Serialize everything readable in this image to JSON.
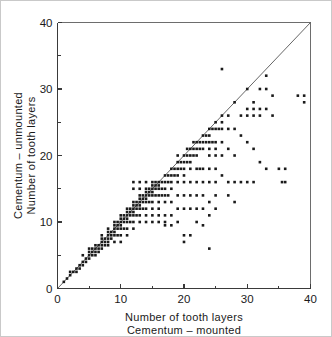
{
  "chart_data": {
    "type": "scatter",
    "title": "",
    "xlabel": "Number of tooth layers",
    "xlabel2": "Cementum – mounted",
    "ylabel": "Cementum – unmounted",
    "ylabel2": "Number of tooth layers",
    "xlim": [
      0,
      40
    ],
    "ylim": [
      0,
      40
    ],
    "xticks": [
      0,
      10,
      20,
      30,
      40
    ],
    "yticks": [
      0,
      10,
      20,
      30,
      40
    ],
    "xticklabels": [
      "0",
      "10",
      "20",
      "30",
      "40"
    ],
    "yticklabels": [
      "0",
      "10",
      "20",
      "30",
      "40"
    ],
    "xminorticks": [
      5,
      15,
      25,
      35
    ],
    "yminorticks": [
      5,
      15,
      25,
      35
    ],
    "grid": false,
    "legend": null,
    "reference_line": {
      "name": "identity-line",
      "type": "y=x",
      "from": [
        0,
        0
      ],
      "to": [
        40,
        40
      ]
    },
    "marker": {
      "shape": "square",
      "size_px": 2.6,
      "color": "#1a1a1a"
    },
    "series": [
      {
        "name": "tooth layer counts",
        "points": [
          [
            1,
            1
          ],
          [
            1.5,
            1.5
          ],
          [
            2,
            2
          ],
          [
            2,
            2.5
          ],
          [
            2.5,
            2.5
          ],
          [
            3,
            3
          ],
          [
            3,
            2.5
          ],
          [
            3.5,
            3.5
          ],
          [
            3.5,
            3
          ],
          [
            4,
            4
          ],
          [
            4,
            3.5
          ],
          [
            4,
            5
          ],
          [
            4.5,
            4
          ],
          [
            4.5,
            4.5
          ],
          [
            5,
            5
          ],
          [
            5,
            4.5
          ],
          [
            5,
            5.5
          ],
          [
            5,
            6
          ],
          [
            5.5,
            5
          ],
          [
            5.5,
            5.5
          ],
          [
            5.5,
            6
          ],
          [
            6,
            6
          ],
          [
            6,
            5.5
          ],
          [
            6,
            5
          ],
          [
            6,
            6.5
          ],
          [
            6.5,
            6
          ],
          [
            6.5,
            6.5
          ],
          [
            6.5,
            5.5
          ],
          [
            7,
            7
          ],
          [
            7,
            6
          ],
          [
            7,
            6.5
          ],
          [
            7,
            7.5
          ],
          [
            7,
            8
          ],
          [
            7.5,
            7
          ],
          [
            7.5,
            7.5
          ],
          [
            7.5,
            6.5
          ],
          [
            8,
            8
          ],
          [
            8,
            7
          ],
          [
            8,
            7.5
          ],
          [
            8,
            8.5
          ],
          [
            8,
            9
          ],
          [
            8,
            6.5
          ],
          [
            8.5,
            8
          ],
          [
            8.5,
            8.5
          ],
          [
            8.5,
            7.5
          ],
          [
            9,
            9
          ],
          [
            9,
            8
          ],
          [
            9,
            8.5
          ],
          [
            9,
            9.5
          ],
          [
            9,
            10
          ],
          [
            9,
            7
          ],
          [
            9.5,
            9
          ],
          [
            9.5,
            9.5
          ],
          [
            9.5,
            10
          ],
          [
            9.5,
            8
          ],
          [
            10,
            10
          ],
          [
            10,
            9
          ],
          [
            10,
            9.5
          ],
          [
            10,
            10.5
          ],
          [
            10,
            11
          ],
          [
            10,
            8
          ],
          [
            10,
            7
          ],
          [
            10.5,
            10
          ],
          [
            10.5,
            10.5
          ],
          [
            10.5,
            11
          ],
          [
            10.5,
            9
          ],
          [
            11,
            11
          ],
          [
            11,
            10
          ],
          [
            11,
            10.5
          ],
          [
            11,
            11.5
          ],
          [
            11,
            12
          ],
          [
            11,
            9
          ],
          [
            11,
            8
          ],
          [
            11.5,
            11
          ],
          [
            11.5,
            11.5
          ],
          [
            11.5,
            12
          ],
          [
            11.5,
            10
          ],
          [
            12,
            12
          ],
          [
            12,
            11
          ],
          [
            12,
            11.5
          ],
          [
            12,
            12.5
          ],
          [
            12,
            13
          ],
          [
            12,
            10
          ],
          [
            12,
            9
          ],
          [
            12,
            15
          ],
          [
            12,
            16
          ],
          [
            12.5,
            12
          ],
          [
            12.5,
            12.5
          ],
          [
            12.5,
            13
          ],
          [
            12.5,
            11
          ],
          [
            13,
            13
          ],
          [
            13,
            12
          ],
          [
            13,
            12.5
          ],
          [
            13,
            13.5
          ],
          [
            13,
            14
          ],
          [
            13,
            11
          ],
          [
            13,
            10
          ],
          [
            13,
            16
          ],
          [
            13,
            15
          ],
          [
            13.5,
            13
          ],
          [
            13.5,
            13.5
          ],
          [
            13.5,
            14
          ],
          [
            13.5,
            12
          ],
          [
            14,
            14
          ],
          [
            14,
            13
          ],
          [
            14,
            13.5
          ],
          [
            14,
            14.5
          ],
          [
            14,
            15
          ],
          [
            14,
            12
          ],
          [
            14,
            11
          ],
          [
            14,
            10
          ],
          [
            14,
            16
          ],
          [
            14.5,
            14
          ],
          [
            14.5,
            14.5
          ],
          [
            14.5,
            15
          ],
          [
            14.5,
            13
          ],
          [
            15,
            15
          ],
          [
            15,
            14
          ],
          [
            15,
            14.5
          ],
          [
            15,
            15.5
          ],
          [
            15,
            16
          ],
          [
            15,
            13
          ],
          [
            15,
            12
          ],
          [
            15,
            11
          ],
          [
            15,
            10
          ],
          [
            15.5,
            15
          ],
          [
            15.5,
            15.5
          ],
          [
            15.5,
            14
          ],
          [
            15.5,
            16
          ],
          [
            16,
            16
          ],
          [
            16,
            15
          ],
          [
            16,
            15.5
          ],
          [
            16,
            14
          ],
          [
            16,
            13
          ],
          [
            16,
            12
          ],
          [
            16,
            11
          ],
          [
            16,
            10
          ],
          [
            16.5,
            16
          ],
          [
            16.5,
            15
          ],
          [
            16.5,
            14
          ],
          [
            17,
            17
          ],
          [
            17,
            16
          ],
          [
            17,
            15
          ],
          [
            17,
            14
          ],
          [
            17,
            13
          ],
          [
            17,
            11
          ],
          [
            17,
            10
          ],
          [
            17,
            9.5
          ],
          [
            17.5,
            17
          ],
          [
            17.5,
            16
          ],
          [
            17.5,
            14
          ],
          [
            18,
            18
          ],
          [
            18,
            17
          ],
          [
            18,
            16
          ],
          [
            18,
            15
          ],
          [
            18,
            13
          ],
          [
            18,
            11
          ],
          [
            18,
            9.5
          ],
          [
            18.5,
            18
          ],
          [
            18.5,
            17
          ],
          [
            19,
            19
          ],
          [
            19,
            18
          ],
          [
            19,
            17
          ],
          [
            19,
            16
          ],
          [
            19,
            14
          ],
          [
            19,
            12
          ],
          [
            19,
            10
          ],
          [
            19,
            20
          ],
          [
            19.5,
            19
          ],
          [
            19.5,
            18
          ],
          [
            20,
            20
          ],
          [
            20,
            19
          ],
          [
            20,
            18
          ],
          [
            20,
            17
          ],
          [
            20,
            16
          ],
          [
            20,
            14
          ],
          [
            20,
            12
          ],
          [
            20,
            8
          ],
          [
            20,
            7
          ],
          [
            20.5,
            20
          ],
          [
            20.5,
            19
          ],
          [
            20.5,
            21
          ],
          [
            21,
            21
          ],
          [
            21,
            20
          ],
          [
            21,
            19
          ],
          [
            21,
            18
          ],
          [
            21,
            16
          ],
          [
            21,
            14
          ],
          [
            21,
            12
          ],
          [
            21,
            8
          ],
          [
            21.5,
            21
          ],
          [
            21.5,
            20
          ],
          [
            21.5,
            22
          ],
          [
            22,
            22
          ],
          [
            22,
            21
          ],
          [
            22,
            20
          ],
          [
            22,
            18
          ],
          [
            22,
            16
          ],
          [
            22,
            14
          ],
          [
            22,
            12
          ],
          [
            22,
            10
          ],
          [
            22.5,
            22
          ],
          [
            22.5,
            21
          ],
          [
            22.5,
            18
          ],
          [
            23,
            23
          ],
          [
            23,
            22
          ],
          [
            23,
            21
          ],
          [
            23,
            18
          ],
          [
            23,
            16
          ],
          [
            23,
            14
          ],
          [
            23,
            12
          ],
          [
            23,
            9.5
          ],
          [
            23.5,
            23
          ],
          [
            23.5,
            22
          ],
          [
            24,
            24
          ],
          [
            24,
            23
          ],
          [
            24,
            22
          ],
          [
            24,
            21
          ],
          [
            24,
            20
          ],
          [
            24,
            18
          ],
          [
            24,
            16
          ],
          [
            24,
            13
          ],
          [
            24,
            11
          ],
          [
            24,
            6
          ],
          [
            24.5,
            24
          ],
          [
            24.5,
            22
          ],
          [
            25,
            25
          ],
          [
            25,
            24
          ],
          [
            25,
            22
          ],
          [
            25,
            21
          ],
          [
            25,
            20
          ],
          [
            25,
            18
          ],
          [
            25,
            16
          ],
          [
            25,
            14
          ],
          [
            25,
            12
          ],
          [
            25.5,
            24
          ],
          [
            26,
            26
          ],
          [
            26,
            25
          ],
          [
            26,
            24
          ],
          [
            26,
            22
          ],
          [
            26,
            20
          ],
          [
            26,
            17
          ],
          [
            26,
            33
          ],
          [
            27,
            26
          ],
          [
            27,
            24
          ],
          [
            27,
            21
          ],
          [
            27,
            16
          ],
          [
            27,
            14
          ],
          [
            28,
            28
          ],
          [
            28,
            24
          ],
          [
            28,
            20
          ],
          [
            28,
            16
          ],
          [
            28,
            13
          ],
          [
            29,
            26
          ],
          [
            29,
            23
          ],
          [
            29,
            16
          ],
          [
            30,
            30
          ],
          [
            30,
            27
          ],
          [
            30,
            26
          ],
          [
            30,
            22
          ],
          [
            30,
            16
          ],
          [
            31,
            28
          ],
          [
            31,
            27
          ],
          [
            31,
            26
          ],
          [
            31,
            21
          ],
          [
            31,
            16
          ],
          [
            32,
            30
          ],
          [
            32,
            27
          ],
          [
            32,
            26
          ],
          [
            32,
            19
          ],
          [
            33,
            32
          ],
          [
            33,
            30
          ],
          [
            33,
            27
          ],
          [
            33,
            18
          ],
          [
            34,
            29
          ],
          [
            34,
            26
          ],
          [
            35,
            18
          ],
          [
            35.5,
            16
          ],
          [
            36,
            18
          ],
          [
            36,
            16
          ],
          [
            38,
            29
          ],
          [
            39,
            28
          ],
          [
            39,
            29
          ]
        ]
      }
    ]
  }
}
